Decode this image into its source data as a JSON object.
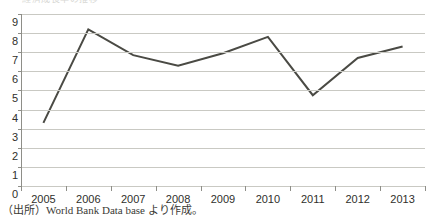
{
  "figure": {
    "clipped_title_fragment": "経済成長率の推移"
  },
  "caption": {
    "text": "（出所）World Bank Data base より作成。"
  },
  "chart_data": {
    "type": "line",
    "title": "",
    "subtitle": "",
    "xlabel": "",
    "ylabel": "",
    "categories": [
      "2005",
      "2006",
      "2007",
      "2008",
      "2009",
      "2010",
      "2011",
      "2012",
      "2013"
    ],
    "values": [
      3.3,
      8.2,
      6.85,
      6.3,
      6.95,
      7.8,
      4.75,
      6.7,
      7.3
    ],
    "series": [
      {
        "name": "",
        "values": [
          3.3,
          8.2,
          6.85,
          6.3,
          6.95,
          7.8,
          4.75,
          6.7,
          7.3
        ]
      }
    ],
    "ylim": [
      0,
      9
    ],
    "yticks": [
      0,
      1,
      2,
      3,
      4,
      5,
      6,
      7,
      8,
      9
    ],
    "ytick_labels": [
      "0",
      "1",
      "2",
      "3",
      "4",
      "5",
      "6",
      "7",
      "8",
      "9"
    ],
    "xtick_labels": [
      "2005",
      "2006",
      "2007",
      "2008",
      "2009",
      "2010",
      "2011",
      "2012",
      "2013"
    ],
    "grid": true,
    "grid_axis": "y",
    "legend": false,
    "legend_position": "none",
    "markers": false,
    "line_color": "#4a4a44",
    "line_width": 2,
    "grid_color": "#c9c9c3",
    "axis_color": "#8e8e88",
    "background_color": "#ffffff",
    "text_color": "#2f2f2b"
  }
}
